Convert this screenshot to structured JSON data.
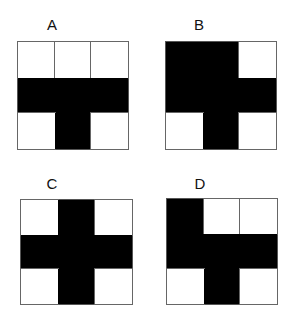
{
  "figures": [
    {
      "label": "A",
      "pos": {
        "x": 17,
        "y": 41,
        "w": 112,
        "h": 109
      },
      "label_pos": {
        "x": 42,
        "y": 17
      },
      "cells": [
        0,
        0,
        0,
        1,
        1,
        1,
        0,
        1,
        0
      ]
    },
    {
      "label": "B",
      "pos": {
        "x": 165,
        "y": 41,
        "w": 112,
        "h": 109
      },
      "label_pos": {
        "x": 189,
        "y": 17
      },
      "cells": [
        1,
        1,
        0,
        1,
        1,
        1,
        0,
        1,
        0
      ]
    },
    {
      "label": "C",
      "pos": {
        "x": 20,
        "y": 199,
        "w": 113,
        "h": 106
      },
      "label_pos": {
        "x": 42,
        "y": 176
      },
      "cells": [
        0,
        1,
        0,
        1,
        1,
        1,
        0,
        1,
        0
      ]
    },
    {
      "label": "D",
      "pos": {
        "x": 166,
        "y": 198,
        "w": 112,
        "h": 107
      },
      "label_pos": {
        "x": 190,
        "y": 176
      },
      "cells": [
        1,
        0,
        0,
        1,
        1,
        1,
        0,
        1,
        0
      ]
    }
  ],
  "legend": {
    "1": "black",
    "0": "white"
  },
  "colors": {
    "filled": "#000000",
    "empty": "#ffffff",
    "border": "#555555"
  }
}
